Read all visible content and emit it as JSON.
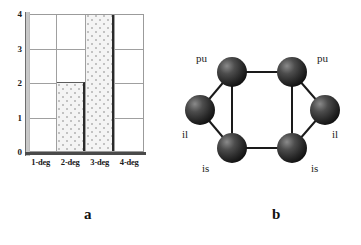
{
  "figure": {
    "panel_a_caption": "a",
    "panel_b_caption": "b"
  },
  "chart_data": {
    "type": "bar",
    "title": "",
    "xlabel": "",
    "ylabel": "",
    "categories": [
      "1-deg",
      "2-deg",
      "3-deg",
      "4-deg"
    ],
    "values": [
      0,
      2,
      4,
      0
    ],
    "ylim": [
      0,
      4
    ],
    "yticks": [
      0,
      1,
      2,
      3,
      4
    ],
    "ytick_labels": [
      "0",
      "1",
      "2",
      "3",
      "4"
    ],
    "grid": true,
    "legend": false,
    "bar_fill": "#f4f4f4",
    "bar_edge": "#2a2a2a",
    "axis_color": "#4a4a4a",
    "grid_color": "#a0a0a0"
  },
  "graph": {
    "node_color": "#2e2e2e",
    "edge_color": "#1a1a1a",
    "nodes": [
      {
        "id": "n-top-left",
        "label": "pu",
        "cx": 52,
        "cy": 72
      },
      {
        "id": "n-top-right",
        "label": "pu",
        "cx": 112,
        "cy": 72
      },
      {
        "id": "n-left",
        "label": "il",
        "cx": 20,
        "cy": 110
      },
      {
        "id": "n-right",
        "label": "il",
        "cx": 145,
        "cy": 110
      },
      {
        "id": "n-bottom-left",
        "label": "is",
        "cx": 52,
        "cy": 148
      },
      {
        "id": "n-bottom-right",
        "label": "is",
        "cx": 112,
        "cy": 148
      }
    ],
    "edges": [
      {
        "from": "n-top-left",
        "to": "n-top-right"
      },
      {
        "from": "n-top-left",
        "to": "n-bottom-left"
      },
      {
        "from": "n-top-right",
        "to": "n-bottom-right"
      },
      {
        "from": "n-bottom-left",
        "to": "n-bottom-right"
      },
      {
        "from": "n-top-left",
        "to": "n-left"
      },
      {
        "from": "n-left",
        "to": "n-bottom-left"
      },
      {
        "from": "n-top-right",
        "to": "n-right"
      },
      {
        "from": "n-right",
        "to": "n-bottom-right"
      }
    ],
    "labels": [
      {
        "name": "label-pu-left",
        "text": "pu",
        "x": 16,
        "y": 52
      },
      {
        "name": "label-pu-right",
        "text": "pu",
        "x": 137,
        "y": 52
      },
      {
        "name": "label-il-left",
        "text": "il",
        "x": 2,
        "y": 128
      },
      {
        "name": "label-il-right",
        "text": "il",
        "x": 152,
        "y": 128
      },
      {
        "name": "label-is-left",
        "text": "is",
        "x": 22,
        "y": 162
      },
      {
        "name": "label-is-right",
        "text": "is",
        "x": 131,
        "y": 162
      }
    ]
  }
}
